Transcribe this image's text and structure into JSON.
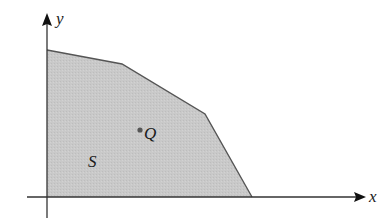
{
  "diagram": {
    "region": {
      "label": "S",
      "fill": "#c8c8c8",
      "stroke": "#555555",
      "vertices": [
        [
          47,
          50
        ],
        [
          122,
          64
        ],
        [
          205,
          114
        ],
        [
          252,
          197
        ],
        [
          47,
          197
        ]
      ]
    },
    "point": {
      "label": "Q",
      "x": 140,
      "y": 130,
      "color": "#555555"
    },
    "axes": {
      "x_label": "x",
      "y_label": "y",
      "color": "#222222"
    }
  }
}
